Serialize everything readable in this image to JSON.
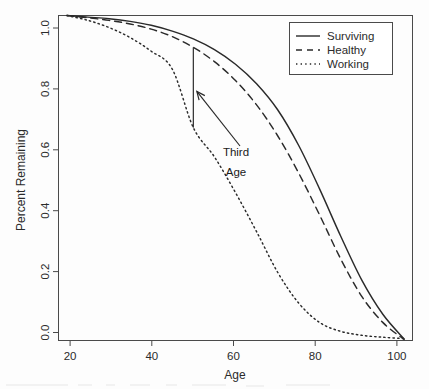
{
  "chart_data": {
    "type": "line",
    "title": "",
    "xlabel": "Age",
    "ylabel": "Percent Remaining",
    "xlim": [
      18,
      102
    ],
    "ylim": [
      0.0,
      1.0
    ],
    "grid": false,
    "legend_position": "top-right",
    "xticks": [
      20,
      40,
      60,
      80,
      100
    ],
    "xtick_labels": [
      "20",
      "40",
      "60",
      "80",
      "100"
    ],
    "yticks": [
      0.0,
      0.2,
      0.4,
      0.6,
      0.8,
      1.0
    ],
    "ytick_labels": [
      "0.0",
      "0.2",
      "0.4",
      "0.6",
      "0.8",
      "1.0"
    ],
    "x": [
      20,
      25,
      30,
      35,
      40,
      45,
      50,
      55,
      60,
      65,
      70,
      75,
      80,
      85,
      90,
      95,
      100
    ],
    "series": [
      {
        "name": "Surviving",
        "style": "solid",
        "values": [
          1.0,
          0.995,
          0.99,
          0.982,
          0.97,
          0.952,
          0.928,
          0.895,
          0.85,
          0.79,
          0.71,
          0.6,
          0.465,
          0.32,
          0.185,
          0.08,
          0.005
        ]
      },
      {
        "name": "Healthy",
        "style": "dashed",
        "values": [
          1.0,
          0.993,
          0.985,
          0.974,
          0.958,
          0.935,
          0.902,
          0.858,
          0.8,
          0.725,
          0.63,
          0.515,
          0.385,
          0.25,
          0.135,
          0.055,
          0.003
        ]
      },
      {
        "name": "Working",
        "style": "dotted",
        "values": [
          1.0,
          0.985,
          0.963,
          0.932,
          0.89,
          0.835,
          0.655,
          0.565,
          0.455,
          0.335,
          0.21,
          0.115,
          0.055,
          0.028,
          0.016,
          0.01,
          0.006
        ]
      }
    ],
    "annotations": [
      {
        "name": "third-age-bracket",
        "label_line1": "Third",
        "label_line2": "Age",
        "at_age": 50,
        "from_value": 0.655,
        "to_value": 0.902
      }
    ]
  },
  "legend": {
    "entries": [
      {
        "label": "Surviving"
      },
      {
        "label": "Healthy"
      },
      {
        "label": "Working"
      }
    ]
  },
  "axes": {
    "x_title": "Age",
    "y_title": "Percent Remaining"
  },
  "annotation": {
    "line1": "Third",
    "line2": "Age"
  },
  "colors": {
    "line": "#2a2a2a",
    "frame": "#4a4a4a",
    "text": "#2b2b2b",
    "background": "#fdfdfd"
  }
}
